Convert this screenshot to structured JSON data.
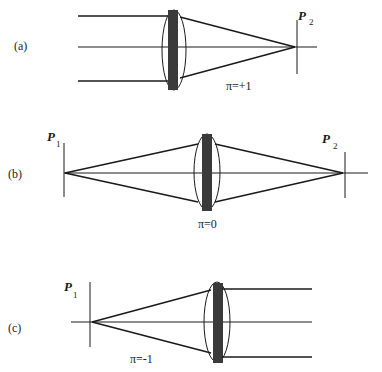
{
  "panels": [
    {
      "id": "a",
      "label": "(a)",
      "pi_label": "π=+1",
      "planes": [
        {
          "name": "P",
          "sub": "2"
        }
      ]
    },
    {
      "id": "b",
      "label": "(b)",
      "pi_label": "π=0",
      "planes": [
        {
          "name": "P",
          "sub": "1"
        },
        {
          "name": "P",
          "sub": "2"
        }
      ]
    },
    {
      "id": "c",
      "label": "(c)",
      "pi_label": "π=-1",
      "planes": [
        {
          "name": "P",
          "sub": "1"
        }
      ]
    }
  ],
  "colors": {
    "line": "#1a1a1a",
    "lens_bar": "#3a3a3a"
  }
}
